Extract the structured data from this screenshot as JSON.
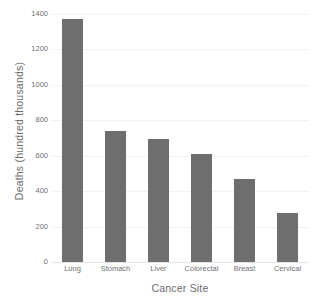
{
  "chart_data": {
    "type": "bar",
    "title": "",
    "categories": [
      "Lung",
      "Stomach",
      "Liver",
      "Colorectal",
      "Breast",
      "Cervical"
    ],
    "values": [
      1370,
      740,
      695,
      612,
      470,
      275
    ],
    "xlabel": "Cancer Site",
    "ylabel": "Deaths (hundred thousands)",
    "ylim": [
      0,
      1400
    ],
    "yticks": [
      0,
      200,
      400,
      600,
      800,
      1000,
      1200,
      1400
    ],
    "ytick_labels": [
      "0",
      "200",
      "400",
      "600",
      "800",
      "1000",
      "1200",
      "1400"
    ],
    "grid": true,
    "legend": "none",
    "bar_color": "#6e6e6e",
    "background_color": "#ffffff",
    "gridline_color": "#f2f2f2",
    "text_color": "#6b6b6b"
  }
}
